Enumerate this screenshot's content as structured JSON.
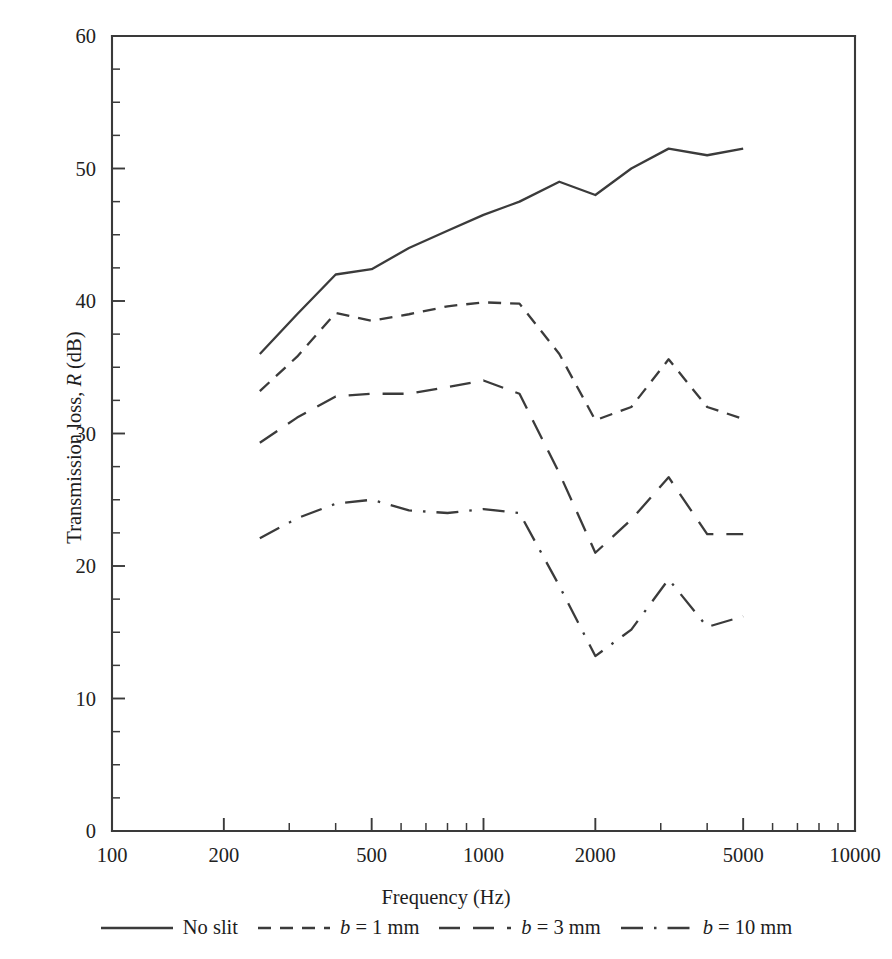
{
  "figure": {
    "background": "#ffffff",
    "ink_color": "#3b3b3b"
  },
  "axes": {
    "x_title_plain": "Frequency (Hz)",
    "y_title_plain": "Transmission loss, R (dB)",
    "y_title_pre": "Transmission loss, ",
    "y_title_ital": "R",
    "y_title_post": " (dB)"
  },
  "legend": {
    "items": [
      {
        "label_plain": "No slit",
        "pre": "No slit",
        "ital": "",
        "post": "",
        "style": "solid"
      },
      {
        "label_plain": "b = 1 mm",
        "pre": "",
        "ital": "b",
        "post": " = 1 mm",
        "style": "dashed"
      },
      {
        "label_plain": "b = 3 mm",
        "pre": "",
        "ital": "b",
        "post": " = 3 mm",
        "style": "longdash"
      },
      {
        "label_plain": "b = 10 mm",
        "pre": "",
        "ital": "b",
        "post": " = 10 mm",
        "style": "dashdot"
      }
    ]
  },
  "chart_data": {
    "type": "line",
    "title": "",
    "xlabel": "Frequency (Hz)",
    "ylabel": "Transmission loss, R (dB)",
    "xscale": "log",
    "yscale": "linear",
    "xlim": [
      100,
      10000
    ],
    "ylim": [
      0,
      60
    ],
    "grid": false,
    "legend_position": "below-axes",
    "x_ticks_major": [
      100,
      200,
      500,
      1000,
      2000,
      5000,
      10000
    ],
    "x_tick_labels": [
      "100",
      "200",
      "500",
      "1000",
      "2000",
      "5000",
      "10000"
    ],
    "x_ticks_minor": [
      300,
      400,
      600,
      700,
      800,
      900,
      3000,
      4000,
      6000,
      7000,
      8000,
      9000
    ],
    "y_ticks_major": [
      0,
      10,
      20,
      30,
      40,
      50,
      60
    ],
    "y_tick_labels": [
      "0",
      "10",
      "20",
      "30",
      "40",
      "50",
      "60"
    ],
    "y_tick_minor_step": 2.5,
    "x": [
      250,
      315,
      400,
      500,
      630,
      800,
      1000,
      1250,
      1600,
      2000,
      2500,
      3150,
      4000,
      5000
    ],
    "series": [
      {
        "name": "No slit",
        "style": "solid",
        "values": [
          36.0,
          39.0,
          42.0,
          42.4,
          44.0,
          45.3,
          46.5,
          47.5,
          49.0,
          48.0,
          50.0,
          51.5,
          51.0,
          51.5
        ]
      },
      {
        "name": "b = 1 mm",
        "style": "dashed",
        "values": [
          33.2,
          35.8,
          39.1,
          38.5,
          39.0,
          39.6,
          39.9,
          39.8,
          36.0,
          31.0,
          32.0,
          35.6,
          32.0,
          31.1
        ]
      },
      {
        "name": "b = 3 mm",
        "style": "longdash",
        "values": [
          29.3,
          31.2,
          32.8,
          33.0,
          33.0,
          33.5,
          34.0,
          33.0,
          27.0,
          21.0,
          23.5,
          26.7,
          22.4,
          22.4
        ]
      },
      {
        "name": "b = 10 mm",
        "style": "dashdot",
        "values": [
          22.1,
          23.6,
          24.7,
          25.0,
          24.2,
          24.0,
          24.3,
          24.0,
          18.5,
          13.2,
          15.2,
          19.0,
          15.4,
          16.2
        ]
      }
    ]
  }
}
